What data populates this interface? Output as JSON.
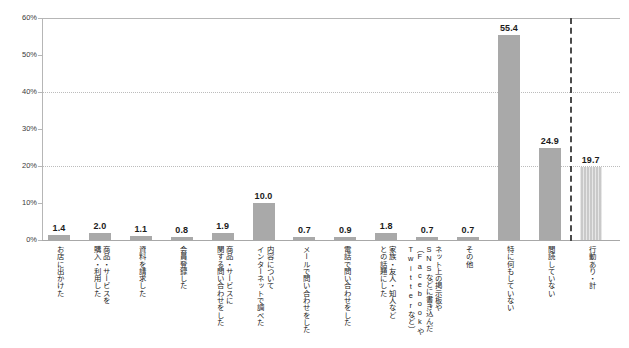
{
  "chart_data": {
    "type": "bar",
    "title": "",
    "subtitle": "",
    "xlabel": "",
    "ylabel": "",
    "ylim": [
      0,
      60
    ],
    "yunit": "%",
    "ytick_labels": [
      "0%",
      "10%",
      "20%",
      "30%",
      "40%",
      "50%",
      "60%"
    ],
    "ytick_values": [
      0,
      10,
      20,
      30,
      40,
      50,
      60
    ],
    "gridlines_at": [
      20,
      40
    ],
    "grid": "dotted-horizontal-partial",
    "legend": "none",
    "categories": [
      "お店に出かけた",
      "商品・サービスを購入・利用した",
      "資料を請求した",
      "会員登録した",
      "商品・サービスに関する問い合わせをした",
      "内容についてインターネットで調べた",
      "メールで問い合わせをした",
      "電話で問い合わせをした",
      "家族・友人・知人などとの話題にした",
      "ネット上の掲示板やSNSなどに書き込んだ（FacebookやTwitterなど）",
      "その他",
      "特に何もしていない",
      "閲読していない",
      "行動あり・計"
    ],
    "values": [
      1.4,
      2.0,
      1.1,
      0.8,
      1.9,
      10.0,
      0.7,
      0.9,
      1.8,
      0.7,
      0.7,
      55.4,
      24.9,
      19.7
    ],
    "value_labels": [
      "1.4",
      "2.0",
      "1.1",
      "0.8",
      "1.9",
      "10.0",
      "0.7",
      "0.9",
      "1.8",
      "0.7",
      "0.7",
      "55.4",
      "24.9",
      "19.7"
    ],
    "bar_styles": [
      "solid",
      "solid",
      "solid",
      "solid",
      "solid",
      "solid",
      "solid",
      "solid",
      "solid",
      "solid",
      "solid",
      "solid",
      "solid",
      "striped-light"
    ],
    "separator_before_index": 13,
    "colors": {
      "bar": "#a9a9a9",
      "bar_light": "#c9c9c9",
      "axis": "#b6b6b6",
      "grid": "#bcbcbc",
      "separator": "#4a4a4a",
      "text": "#231f20",
      "background": "#ffffff"
    }
  },
  "category_label_lines": [
    [
      "お店に出かけた"
    ],
    [
      "商品・サービスを",
      "購入・利用した"
    ],
    [
      "資料を請求した"
    ],
    [
      "会員登録した"
    ],
    [
      "商品・サービスに",
      "関する問い合わせをした"
    ],
    [
      "内容について",
      "インターネットで調べた"
    ],
    [
      "メールで問い合わせをした"
    ],
    [
      "電話で問い合わせをした"
    ],
    [
      "家族・友人・知人など",
      "との話題にした"
    ],
    [
      "ネット上の掲示板や",
      "SNSなどに書き込んだ",
      "（FacebookやTwitterなど）"
    ],
    [
      "その他"
    ],
    [
      "特に何もしていない"
    ],
    [
      "閲読していない"
    ],
    [
      "行動あり・計"
    ]
  ]
}
